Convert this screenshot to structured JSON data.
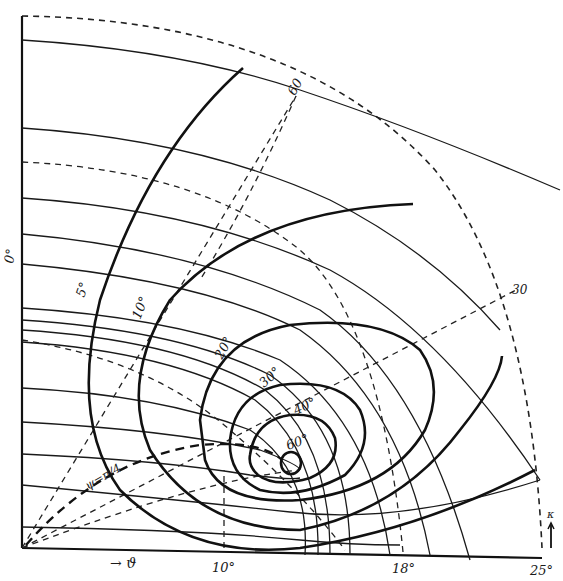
{
  "figure": {
    "type": "quarter-circle contour diagram",
    "colors": {
      "ink": "#111111",
      "paper": "#ffffff"
    },
    "origin_px": [
      22,
      548
    ],
    "outer_radius_px": 522,
    "axes": {
      "horizontal_arrow_label": "→ ϑ",
      "vertical_arrow_label": "κ ↑",
      "left_edge_label": "0°"
    },
    "bottom_ticks": [
      {
        "label": "10°",
        "x": 224
      },
      {
        "label": "18°",
        "x": 403
      },
      {
        "label": "25°",
        "x": 540
      }
    ],
    "radial_dashed_labels": [
      {
        "label": "60",
        "x": 297,
        "y": 90
      },
      {
        "label": "30",
        "x": 516,
        "y": 292
      }
    ],
    "contour_labels": [
      {
        "label": "5°",
        "x": 90,
        "y": 296,
        "rotate": -70
      },
      {
        "label": "10°",
        "x": 146,
        "y": 318,
        "rotate": -68
      },
      {
        "label": "20°",
        "x": 226,
        "y": 355,
        "rotate": -62
      },
      {
        "label": "30°",
        "x": 270,
        "y": 385,
        "rotate": -42
      },
      {
        "label": "40°",
        "x": 302,
        "y": 412,
        "rotate": -25
      },
      {
        "label": "60°",
        "x": 296,
        "y": 446,
        "rotate": -20
      }
    ],
    "curve_label": {
      "label": "ψ=π/4",
      "x": 92,
      "y": 487,
      "rotate": -30
    }
  }
}
